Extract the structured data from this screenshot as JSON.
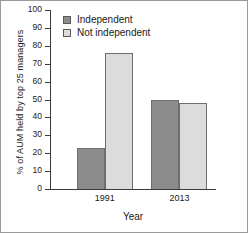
{
  "chart_data": {
    "type": "bar",
    "title": "",
    "xlabel": "Year",
    "ylabel": "% of AUM held by top 25 managers",
    "categories": [
      "1991",
      "2013"
    ],
    "series": [
      {
        "name": "Independent",
        "color": "#8c8c8c",
        "values": [
          23,
          76
        ]
      },
      {
        "name": "Not independent",
        "color": "#dcdcdc",
        "values": [
          76,
          48
        ]
      }
    ],
    "series_display": [
      {
        "name": "Independent",
        "color": "#8c8c8c",
        "values": [
          23,
          50
        ]
      },
      {
        "name": "Not independent",
        "color": "#dcdcdc",
        "values": [
          76,
          48
        ]
      }
    ],
    "ylim": [
      0,
      100
    ],
    "ytick_labels": [
      "0",
      "10",
      "20",
      "30",
      "40",
      "50",
      "60",
      "70",
      "80",
      "90",
      "100"
    ],
    "ytick_values": [
      0,
      10,
      20,
      30,
      40,
      50,
      60,
      70,
      80,
      90,
      100
    ],
    "grid": false,
    "legend_position": "top-left",
    "frame": "left-bottom-spines"
  },
  "legend": {
    "items": [
      {
        "label": "Independent"
      },
      {
        "label": "Not independent"
      }
    ]
  }
}
